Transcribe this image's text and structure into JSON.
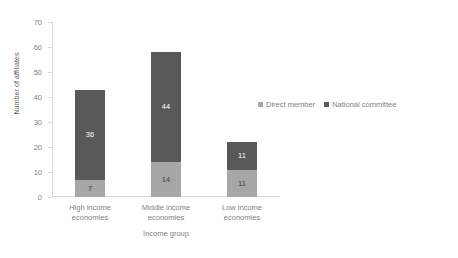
{
  "chart_data": {
    "type": "bar",
    "subtype": "stacked-bar",
    "title": "",
    "xlabel": "Income group",
    "ylabel": "Number of affiliates",
    "categories": [
      "High income\neconomies",
      "Middle income\neconomies",
      "Low income\neconomies"
    ],
    "series": [
      {
        "name": "Direct member",
        "color": "#a6a6a6",
        "values": [
          7,
          14,
          11
        ]
      },
      {
        "name": "National committee",
        "color": "#595959",
        "values": [
          36,
          44,
          11
        ]
      }
    ],
    "totals": [
      43,
      58,
      22
    ],
    "ylim": [
      0,
      70
    ],
    "ytick_labels": [
      "0",
      "10",
      "20",
      "30",
      "40",
      "50",
      "60",
      "70"
    ],
    "ytick_values": [
      0,
      10,
      20,
      30,
      40,
      50,
      60,
      70
    ],
    "grid": false,
    "legend_position": "right",
    "data_labels": [
      [
        "7",
        "36"
      ],
      [
        "14",
        "44"
      ],
      [
        "11",
        "11"
      ]
    ]
  },
  "colors": {
    "direct_member": "#a6a6a6",
    "national_committee": "#595959",
    "axis": "#d9d9d9",
    "tick_text": "#7f7f7f",
    "background": "#ffffff"
  }
}
